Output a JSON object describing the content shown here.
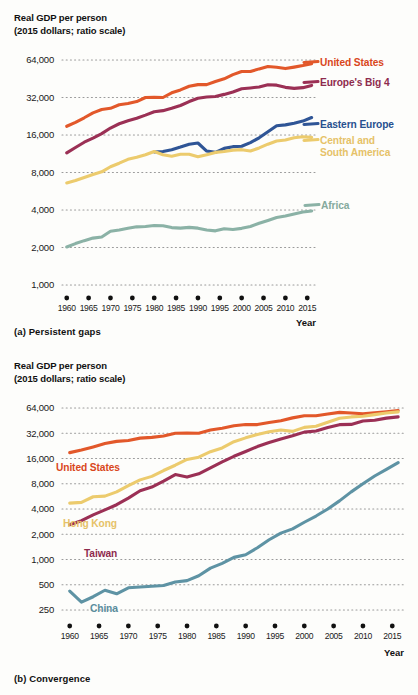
{
  "figure": {
    "axis_title_line1": "Real GDP per person",
    "axis_title_line2": "(2015 dollars; ratio scale)",
    "x_axis_label": "Year",
    "caption_a": "(a) Persistent gaps",
    "caption_b": "(b) Convergence",
    "grid_color": "#9a9a9a",
    "tick_dot_color": "#111111"
  },
  "chart_data": [
    {
      "id": "persistent-gaps",
      "type": "line",
      "title": "(a) Persistent gaps",
      "xlabel": "Year",
      "ylabel": "Real GDP per person (2015 dollars; ratio scale)",
      "yscale": "log",
      "ylim": [
        1000,
        64000
      ],
      "yticks": [
        1000,
        2000,
        4000,
        8000,
        16000,
        32000,
        64000
      ],
      "ytick_labels": [
        "1,000",
        "2,000",
        "4,000",
        "8,000",
        "16,000",
        "32,000",
        "64,000"
      ],
      "xlim": [
        1958,
        2017
      ],
      "xticks": [
        1960,
        1965,
        1970,
        1975,
        1980,
        1985,
        1990,
        1995,
        2000,
        2005,
        2010,
        2015
      ],
      "xtick_labels": [
        "1960",
        "1965",
        "1970",
        "1975",
        "1980",
        "1985",
        "1990",
        "1995",
        "2000",
        "2005",
        "2010",
        "2015"
      ],
      "grid": true,
      "legend": "inline-right",
      "series": [
        {
          "name": "United States",
          "color": "#e2582a",
          "label_color": "#d9471c",
          "label_lines": [
            "United States"
          ],
          "x": [
            1960,
            1962,
            1964,
            1966,
            1968,
            1970,
            1972,
            1974,
            1976,
            1978,
            1980,
            1982,
            1984,
            1986,
            1988,
            1990,
            1992,
            1994,
            1996,
            1998,
            2000,
            2002,
            2004,
            2006,
            2008,
            2010,
            2012,
            2014,
            2016
          ],
          "values": [
            18800,
            20200,
            22000,
            24100,
            25600,
            26200,
            28000,
            28600,
            29700,
            32000,
            32100,
            32000,
            34900,
            36800,
            39400,
            40600,
            40600,
            43000,
            45200,
            48800,
            51800,
            51700,
            54300,
            56700,
            55900,
            54600,
            56100,
            57800,
            59800
          ]
        },
        {
          "name": "Europe's Big 4",
          "color": "#9b3055",
          "label_color": "#8e2b4d",
          "label_lines": [
            "Europe's Big 4"
          ],
          "x": [
            1960,
            1962,
            1964,
            1966,
            1968,
            1970,
            1972,
            1974,
            1976,
            1978,
            1980,
            1982,
            1984,
            1986,
            1988,
            1990,
            1992,
            1994,
            1996,
            1998,
            2000,
            2002,
            2004,
            2006,
            2008,
            2010,
            2012,
            2014,
            2016
          ],
          "values": [
            11500,
            12700,
            14000,
            15100,
            16400,
            18200,
            19700,
            20800,
            21800,
            23100,
            24600,
            25100,
            26200,
            27600,
            29700,
            31600,
            32300,
            32600,
            33900,
            35400,
            37600,
            38200,
            38900,
            40500,
            40200,
            38600,
            37900,
            38400,
            40000
          ]
        },
        {
          "name": "Eastern Europe",
          "color": "#2f5596",
          "label_color": "#27508f",
          "label_lines": [
            "Eastern Europe"
          ],
          "x": [
            1980,
            1982,
            1984,
            1986,
            1988,
            1990,
            1992,
            1994,
            1996,
            1998,
            2000,
            2002,
            2004,
            2006,
            2008,
            2010,
            2012,
            2014,
            2016
          ],
          "values": [
            11700,
            11800,
            12200,
            12800,
            13500,
            13800,
            11900,
            11600,
            12500,
            12900,
            13000,
            13900,
            15200,
            17000,
            19000,
            19300,
            19900,
            20700,
            22100
          ]
        },
        {
          "name": "Central and South America",
          "color": "#eccb6d",
          "label_color": "#e6c268",
          "label_lines": [
            "Central and",
            "South America"
          ],
          "x": [
            1960,
            1962,
            1964,
            1966,
            1968,
            1970,
            1972,
            1974,
            1976,
            1978,
            1980,
            1982,
            1984,
            1986,
            1988,
            1990,
            1992,
            1994,
            1996,
            1998,
            2000,
            2002,
            2004,
            2006,
            2008,
            2010,
            2012,
            2014,
            2016
          ],
          "values": [
            6600,
            6900,
            7300,
            7700,
            8100,
            8900,
            9500,
            10200,
            10600,
            11100,
            11800,
            11100,
            10800,
            11200,
            11200,
            10700,
            11100,
            11600,
            11800,
            12100,
            12200,
            11900,
            12600,
            13500,
            14300,
            14600,
            15200,
            15500,
            15300
          ]
        },
        {
          "name": "Africa",
          "color": "#8bb2a6",
          "label_color": "#85aa9d",
          "label_lines": [
            "Africa"
          ],
          "x": [
            1960,
            1962,
            1964,
            1966,
            1968,
            1970,
            1972,
            1974,
            1976,
            1978,
            1980,
            1982,
            1984,
            1986,
            1988,
            1990,
            1992,
            1994,
            1996,
            1998,
            2000,
            2002,
            2004,
            2006,
            2008,
            2010,
            2012,
            2014,
            2016
          ],
          "values": [
            2020,
            2150,
            2270,
            2380,
            2430,
            2700,
            2760,
            2850,
            2930,
            2950,
            3000,
            2990,
            2890,
            2860,
            2900,
            2860,
            2760,
            2720,
            2830,
            2790,
            2850,
            2950,
            3130,
            3300,
            3480,
            3580,
            3720,
            3850,
            3930
          ]
        }
      ]
    },
    {
      "id": "convergence",
      "type": "line",
      "title": "(b) Convergence",
      "xlabel": "Year",
      "ylabel": "Real GDP per person (2015 dollars; ratio scale)",
      "yscale": "log",
      "ylim": [
        250,
        64000
      ],
      "yticks": [
        250,
        500,
        1000,
        2000,
        4000,
        8000,
        16000,
        32000,
        64000
      ],
      "ytick_labels": [
        "250",
        "500",
        "1,000",
        "2,000",
        "4,000",
        "8,000",
        "16,000",
        "32,000",
        "64,000"
      ],
      "xlim": [
        1958,
        2017
      ],
      "xticks": [
        1960,
        1965,
        1970,
        1975,
        1980,
        1985,
        1990,
        1995,
        2000,
        2005,
        2010,
        2015
      ],
      "xtick_labels": [
        "1960",
        "1965",
        "1970",
        "1975",
        "1980",
        "1985",
        "1990",
        "1995",
        "2000",
        "2005",
        "2010",
        "2015"
      ],
      "grid": true,
      "legend": "inline-left",
      "series": [
        {
          "name": "United States",
          "color": "#e2582a",
          "label_color": "#d9471c",
          "label_lines": [
            "United States"
          ],
          "x": [
            1960,
            1962,
            1964,
            1966,
            1968,
            1970,
            1972,
            1974,
            1976,
            1978,
            1980,
            1982,
            1984,
            1986,
            1988,
            1990,
            1992,
            1994,
            1996,
            1998,
            2000,
            2002,
            2004,
            2006,
            2008,
            2010,
            2012,
            2014,
            2016
          ],
          "values": [
            18800,
            20200,
            22000,
            24100,
            25600,
            26200,
            28000,
            28600,
            29700,
            32000,
            32100,
            32000,
            34900,
            36800,
            39400,
            40600,
            40600,
            43000,
            45200,
            48800,
            51800,
            51700,
            54300,
            56700,
            55900,
            54600,
            56100,
            57800,
            59800
          ]
        },
        {
          "name": "Hong Kong",
          "color": "#eccb6d",
          "label_color": "#e6c268",
          "label_lines": [
            "Hong Kong"
          ],
          "x": [
            1960,
            1962,
            1964,
            1966,
            1968,
            1970,
            1972,
            1974,
            1976,
            1978,
            1980,
            1982,
            1984,
            1986,
            1988,
            1990,
            1992,
            1994,
            1996,
            1998,
            2000,
            2002,
            2004,
            2006,
            2008,
            2010,
            2012,
            2014,
            2016
          ],
          "values": [
            4700,
            4800,
            5600,
            5700,
            6400,
            7600,
            8900,
            9800,
            11500,
            13300,
            15600,
            16600,
            19300,
            21400,
            25400,
            28200,
            31000,
            33300,
            35000,
            33700,
            37600,
            38800,
            43300,
            48200,
            50100,
            51000,
            53300,
            55900,
            57500
          ]
        },
        {
          "name": "Taiwan",
          "color": "#9b3055",
          "label_color": "#8e2b4d",
          "label_lines": [
            "Taiwan"
          ],
          "x": [
            1960,
            1962,
            1964,
            1966,
            1968,
            1970,
            1972,
            1974,
            1976,
            1978,
            1980,
            1982,
            1984,
            1986,
            1988,
            1990,
            1992,
            1994,
            1996,
            1998,
            2000,
            2002,
            2004,
            2006,
            2008,
            2010,
            2012,
            2014,
            2016
          ],
          "values": [
            2600,
            2900,
            3400,
            3900,
            4500,
            5400,
            6600,
            7300,
            8600,
            10300,
            9600,
            10500,
            12400,
            14600,
            17000,
            19400,
            22200,
            24800,
            27400,
            29800,
            33000,
            34000,
            37500,
            40500,
            40800,
            44800,
            45800,
            48500,
            50200
          ]
        },
        {
          "name": "China",
          "color": "#5e93a4",
          "label_color": "#5a8d9e",
          "label_lines": [
            "China"
          ],
          "x": [
            1960,
            1962,
            1964,
            1966,
            1968,
            1970,
            1972,
            1974,
            1976,
            1978,
            1980,
            1982,
            1984,
            1986,
            1988,
            1990,
            1992,
            1994,
            1996,
            1998,
            2000,
            2002,
            2004,
            2006,
            2008,
            2010,
            2012,
            2014,
            2016
          ],
          "values": [
            420,
            310,
            360,
            430,
            390,
            460,
            470,
            480,
            490,
            540,
            560,
            640,
            790,
            900,
            1060,
            1140,
            1380,
            1720,
            2060,
            2320,
            2780,
            3300,
            4000,
            5000,
            6400,
            8000,
            9900,
            11900,
            14300
          ]
        }
      ]
    }
  ]
}
